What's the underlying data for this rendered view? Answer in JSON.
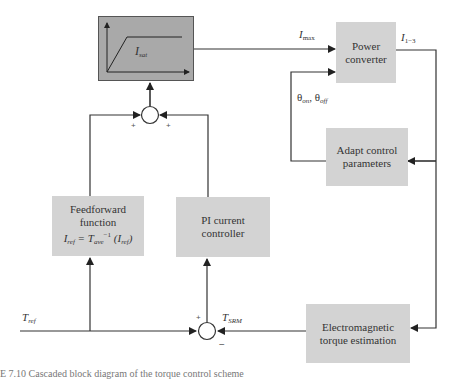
{
  "diagram": {
    "blocks": {
      "saturation": {
        "label_main": "I",
        "label_sub": "sat",
        "fill": "#a9a9a9"
      },
      "power_converter": {
        "label": "Power\nconverter",
        "fill": "#d3d3d3"
      },
      "adapt_control": {
        "label": "Adapt control\nparameters",
        "fill": "#d3d3d3"
      },
      "feedforward": {
        "line1": "Feedforward",
        "line2": "function",
        "eq_lhs": "I",
        "eq_lhs_sub": "ref",
        "eq_mid": " = T",
        "eq_mid_sub": "ave",
        "eq_sup": "−1",
        "eq_rhs": " (I",
        "eq_rhs_sub": "ref",
        "eq_end": ")",
        "fill": "#d3d3d3"
      },
      "pi_controller": {
        "label": "PI current\ncontroller",
        "fill": "#d3d3d3"
      },
      "torque_estimation": {
        "label": "Electromagnetic\ntorque estimation",
        "fill": "#d3d3d3"
      }
    },
    "signals": {
      "imax": {
        "main": "I",
        "sub": "max"
      },
      "i13": {
        "main": "I",
        "sub": "1−3"
      },
      "theta": {
        "main1": "θ",
        "sub1": "on",
        "sep": ", ",
        "main2": "θ",
        "sub2": "off"
      },
      "tref": {
        "main": "T",
        "sub": "ref"
      },
      "tsrm": {
        "main": "T",
        "sub": "SRM"
      }
    },
    "junctions": {
      "top": {
        "left_sign": "+",
        "right_sign": "+"
      },
      "bottom": {
        "top_sign": "+",
        "bottom_sign": "−"
      }
    },
    "caption": "E 7.10   Cascaded block diagram of the torque control scheme"
  }
}
